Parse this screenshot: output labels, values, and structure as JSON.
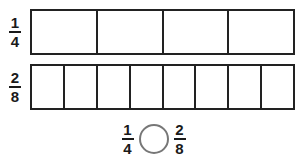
{
  "worksheet": {
    "title": "Fraction comparison model",
    "background_color": "#ffffff",
    "bar_border_color": "#222222",
    "circle_border_color": "#777777",
    "text_color": "#1a1a1a"
  },
  "rows": [
    {
      "label": {
        "numerator": "1",
        "denominator": "4"
      },
      "parts": 4,
      "shaded": 0,
      "cells": [
        "",
        "",
        "",
        ""
      ]
    },
    {
      "label": {
        "numerator": "2",
        "denominator": "8"
      },
      "parts": 8,
      "shaded": 0,
      "cells": [
        "",
        "",
        "",
        "",
        "",
        "",
        "",
        ""
      ]
    }
  ],
  "comparison": {
    "left_fraction": {
      "numerator": "1",
      "denominator": "4"
    },
    "operator_symbol": "",
    "operator_placeholder_shape": "circle",
    "right_fraction": {
      "numerator": "2",
      "denominator": "8"
    }
  }
}
